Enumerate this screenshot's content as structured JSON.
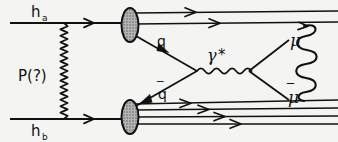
{
  "figure": {
    "kind": "feynman-diagram",
    "width": 338,
    "height": 142,
    "background_color": "#f4f4f2",
    "ink_color": "#111111",
    "blob_fill_color": "#9a9a9a"
  },
  "labels": {
    "hadron_a": "h",
    "hadron_a_sub": "a",
    "hadron_b": "h",
    "hadron_b_sub": "b",
    "pomeron": "P(?)",
    "quark": "q",
    "antiquark": "q",
    "antiquark_bar": "‾",
    "photon": "γ",
    "photon_star": "*",
    "muon": "μ",
    "antimuon": "μ",
    "antimuon_bar": "‾"
  },
  "diagram_data": {
    "incoming_lines": [
      {
        "name": "hadron-a-beam",
        "x1": 10,
        "y1": 23,
        "x2": 128,
        "y2": 23,
        "arrow_at": 0.72
      },
      {
        "name": "hadron-b-beam",
        "x1": 10,
        "y1": 119,
        "x2": 128,
        "y2": 119,
        "arrow_at": 0.72
      }
    ],
    "exchange": {
      "name": "pomeron-zigzag",
      "x": 64,
      "y_top": 23,
      "y_bottom": 119,
      "amplitude": 3.4,
      "periods": 15
    },
    "blobs": [
      {
        "name": "upper-hadron-blob",
        "cx": 130,
        "cy": 25,
        "rx": 8.5,
        "ry": 17
      },
      {
        "name": "lower-hadron-blob",
        "cx": 130,
        "cy": 117,
        "rx": 8.5,
        "ry": 17
      }
    ],
    "spectator_jets_top": [
      {
        "x1": 137,
        "y1": 14,
        "x2": 338,
        "y2": 12,
        "arrow_at": 0.35
      },
      {
        "x1": 137,
        "y1": 24,
        "x2": 338,
        "y2": 22,
        "arrow_at": 0.45
      }
    ],
    "spectator_jets_bottom": [
      {
        "x1": 137,
        "y1": 104,
        "x2": 338,
        "y2": 100,
        "arrow_at": 0.28
      },
      {
        "x1": 137,
        "y1": 110,
        "x2": 338,
        "y2": 108,
        "arrow_at": 0.38
      },
      {
        "x1": 137,
        "y1": 117,
        "x2": 338,
        "y2": 116,
        "arrow_at": 0.45
      },
      {
        "x1": 137,
        "y1": 124,
        "x2": 338,
        "y2": 124,
        "arrow_at": 0.52
      }
    ],
    "quark_line": {
      "name": "quark",
      "x1": 136,
      "y1": 36,
      "x2": 196,
      "y2": 71,
      "arrow_at": 0.52
    },
    "antiquark_line": {
      "name": "antiquark",
      "x1": 196,
      "y1": 71,
      "x2": 136,
      "y2": 106,
      "arrow_at": 0.55
    },
    "photon_line": {
      "name": "virtual-photon",
      "x1": 196,
      "y1": 71,
      "x2": 250,
      "y2": 71,
      "amplitude": 3.6,
      "periods": 7
    },
    "muon_line": {
      "name": "muon",
      "x1": 250,
      "y1": 71,
      "x2": 288,
      "y2": 41
    },
    "antimuon_line": {
      "name": "antimuon",
      "x1": 250,
      "y1": 71,
      "x2": 288,
      "y2": 99
    },
    "right_coil": {
      "name": "hadronization-coil",
      "x": 307,
      "y_top": 24,
      "y_bottom": 101,
      "loops": 5,
      "width": 16
    },
    "label_positions": {
      "hadron_a": {
        "x": 31,
        "y": 16
      },
      "pomeron": {
        "x": 18,
        "y": 76
      },
      "hadron_b": {
        "x": 31,
        "y": 136
      },
      "quark": {
        "x": 158,
        "y": 44
      },
      "antiquark": {
        "x": 159,
        "y": 97
      },
      "photon": {
        "x": 212,
        "y": 58
      },
      "muon": {
        "x": 290,
        "y": 44
      },
      "antimuon": {
        "x": 288,
        "y": 99
      }
    }
  }
}
